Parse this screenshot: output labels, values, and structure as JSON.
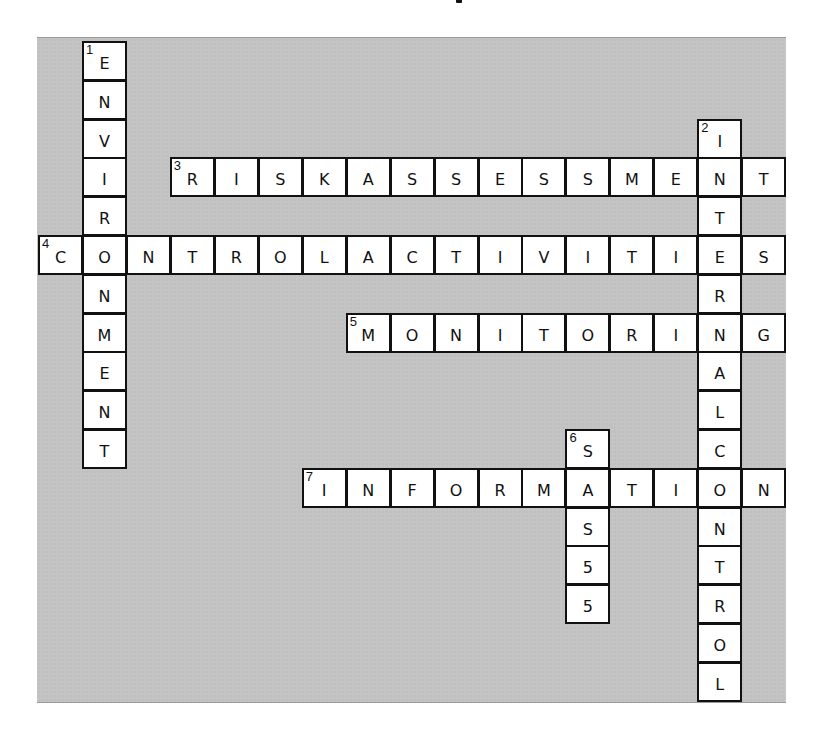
{
  "puzzle": {
    "type": "crossword",
    "grid": {
      "cols": 17,
      "rows": 17
    },
    "colors": {
      "board": "#c4c4c4",
      "cell": "#ffffff",
      "border": "#111111",
      "text": "#111111"
    },
    "entries": [
      {
        "number": "1",
        "direction": "down",
        "answer": "ENVIRONMENT",
        "row": 0,
        "col": 1
      },
      {
        "number": "2",
        "direction": "down",
        "answer": "INTERNALCONTROL",
        "row": 2,
        "col": 15
      },
      {
        "number": "3",
        "direction": "across",
        "answer": "RISKASSESSMENT",
        "row": 3,
        "col": 3
      },
      {
        "number": "4",
        "direction": "across",
        "answer": "CONTROLACTIVITIES",
        "row": 5,
        "col": 0
      },
      {
        "number": "5",
        "direction": "across",
        "answer": "MONITORING",
        "row": 7,
        "col": 7
      },
      {
        "number": "6",
        "direction": "down",
        "answer": "SAS55",
        "row": 10,
        "col": 12
      },
      {
        "number": "7",
        "direction": "across",
        "answer": "INFORMATION",
        "row": 11,
        "col": 6
      }
    ]
  }
}
